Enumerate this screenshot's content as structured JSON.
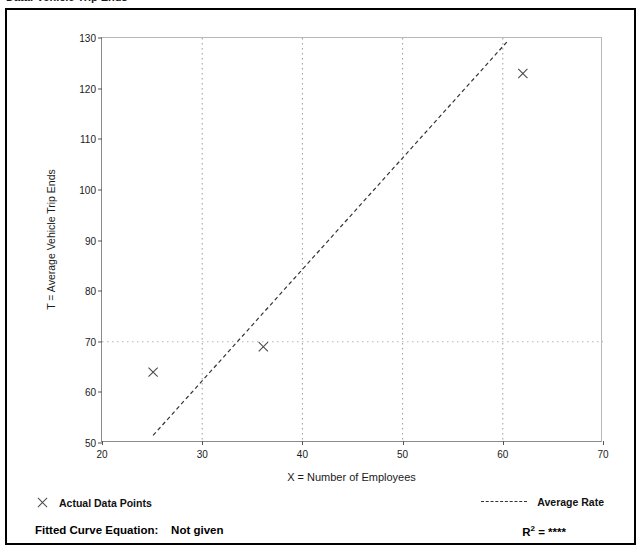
{
  "figure": {
    "cut_title": "Data:  Vehicle Trip Ends"
  },
  "axes": {
    "ylabel": "T = Average Vehicle Trip Ends",
    "xlabel": "X = Number of Employees",
    "yticks": [
      50,
      60,
      70,
      80,
      90,
      100,
      110,
      120,
      130
    ],
    "xticks": [
      20,
      30,
      40,
      50,
      60,
      70
    ]
  },
  "legend": {
    "points_label": "Actual Data Points",
    "rate_label": "Average Rate",
    "point_marker": "x-marker-icon",
    "rate_marker": "dashed-line-icon"
  },
  "footer": {
    "equation_label": "Fitted Curve Equation:",
    "equation_value": "Not given",
    "r2_label": "R",
    "r2_exponent": "2",
    "r2_equals": " = ",
    "r2_value": "****"
  },
  "chart_data": {
    "type": "scatter",
    "title": "",
    "xlabel": "X = Number of Employees",
    "ylabel": "T = Average Vehicle Trip Ends",
    "xlim": [
      20,
      70
    ],
    "ylim": [
      50,
      130
    ],
    "xticks": [
      20,
      30,
      40,
      50,
      60,
      70
    ],
    "yticks": [
      50,
      60,
      70,
      80,
      90,
      100,
      110,
      120,
      130
    ],
    "grid": "vertical-dotted-at-xticks",
    "legend_position": "below-axes",
    "series": [
      {
        "name": "Actual Data Points",
        "type": "scatter",
        "marker": "x",
        "color": "#4a4a4a",
        "points": [
          {
            "x": 25.1,
            "y": 64.0
          },
          {
            "x": 36.1,
            "y": 69.0
          },
          {
            "x": 62.0,
            "y": 123.0
          }
        ]
      },
      {
        "name": "Average Rate",
        "type": "line",
        "style": "dashed",
        "color": "#333333",
        "points": [
          {
            "x": 25.1,
            "y": 51.5
          },
          {
            "x": 60.4,
            "y": 129.2
          }
        ]
      }
    ]
  }
}
